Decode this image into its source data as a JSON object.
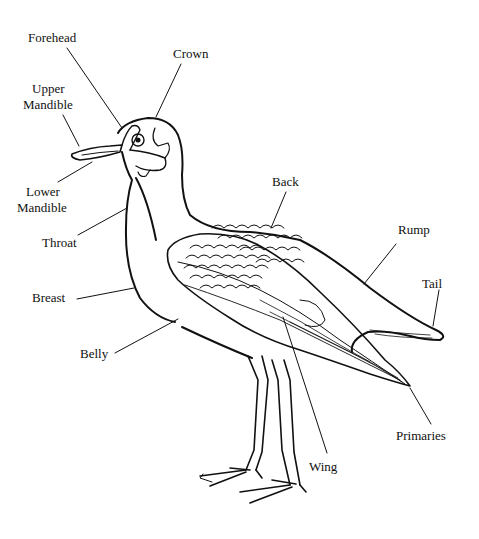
{
  "diagram": {
    "ink_color": "#111111",
    "background": "#ffffff",
    "labels": [
      {
        "id": "forehead",
        "text": "Forehead"
      },
      {
        "id": "crown",
        "text": "Crown"
      },
      {
        "id": "upper_mandible_1",
        "text": "Upper"
      },
      {
        "id": "upper_mandible_2",
        "text": "Mandible"
      },
      {
        "id": "lower_mandible_1",
        "text": "Lower"
      },
      {
        "id": "lower_mandible_2",
        "text": "Mandible"
      },
      {
        "id": "throat",
        "text": "Throat"
      },
      {
        "id": "breast",
        "text": "Breast"
      },
      {
        "id": "belly",
        "text": "Belly"
      },
      {
        "id": "back",
        "text": "Back"
      },
      {
        "id": "rump",
        "text": "Rump"
      },
      {
        "id": "tail",
        "text": "Tail"
      },
      {
        "id": "primaries",
        "text": "Primaries"
      },
      {
        "id": "wing",
        "text": "Wing"
      }
    ]
  }
}
